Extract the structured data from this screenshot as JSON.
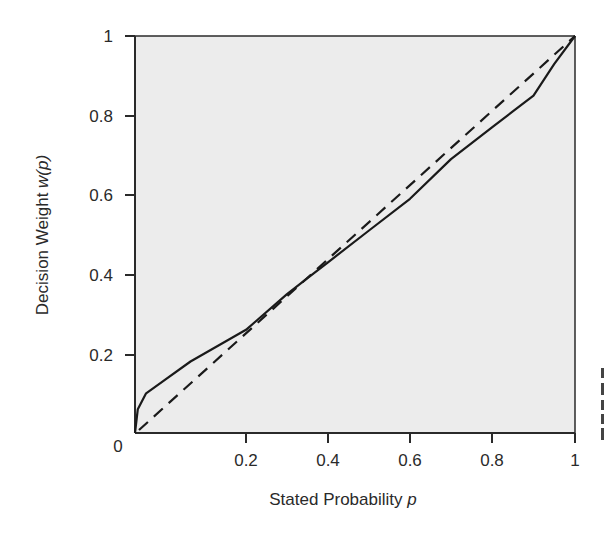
{
  "chart_data": {
    "type": "line",
    "title": "",
    "xlabel": "Stated Probability p",
    "ylabel": "Decision Weight w(p)",
    "xlim": [
      0,
      1
    ],
    "ylim": [
      0,
      1
    ],
    "grid": false,
    "legend": null,
    "x_ticks": [
      "0",
      "0.2",
      "0.4",
      "0.6",
      "0.8",
      "1"
    ],
    "y_ticks": [
      "0",
      "0.2",
      "0.4",
      "0.6",
      "0.8",
      "1"
    ],
    "series": [
      {
        "name": "Decision weight w(p)",
        "style": "solid",
        "x": [
          0,
          0.005,
          0.02,
          0.05,
          0.1,
          0.2,
          0.3,
          0.35,
          0.4,
          0.5,
          0.6,
          0.7,
          0.8,
          0.85,
          0.9,
          0.95,
          1.0
        ],
        "y": [
          0,
          0.06,
          0.1,
          0.13,
          0.18,
          0.26,
          0.35,
          0.39,
          0.43,
          0.51,
          0.59,
          0.69,
          0.77,
          0.81,
          0.85,
          0.93,
          1.0
        ]
      },
      {
        "name": "Identity w(p) = p",
        "style": "dashed",
        "x": [
          0,
          1
        ],
        "y": [
          0,
          1
        ]
      }
    ],
    "colors": {
      "plot_background": "#ececec",
      "line": "#1a1a1a",
      "axis": "#2a2a2a"
    }
  },
  "axes": {
    "x_label": "Stated Probability ",
    "x_label_var": "p",
    "y_label": "Decision Weight ",
    "y_label_var": "w(p)",
    "origin_label": "0"
  }
}
